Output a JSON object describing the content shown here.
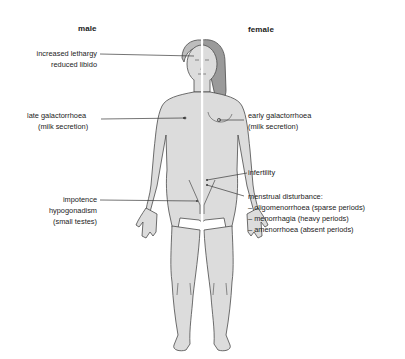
{
  "diagram": {
    "headings": {
      "male": "male",
      "female": "female"
    },
    "labels": {
      "lethargy": [
        "increased lethargy",
        "reduced libido"
      ],
      "late_galactorrhoea": [
        "late galactorrhoea",
        "(milk secretion)"
      ],
      "impotence": [
        "impotence",
        "hypogonadism",
        "(small testes)"
      ],
      "early_galactorrhoea": [
        "early galactorrhoea",
        "(milk secretion)"
      ],
      "infertility": [
        "infertility"
      ],
      "menstrual": [
        "menstrual disturbance:",
        "– oligomenorrhoea (sparse periods)",
        "– menorrhagia (heavy periods)",
        "– amenorrhoea (absent periods)"
      ]
    },
    "colors": {
      "body_fill": "#dcdcdc",
      "outline": "#4a4a4a",
      "hair": "#9a9a9a",
      "divider": "#ffffff",
      "leader_line": "#3a3a3a"
    }
  }
}
